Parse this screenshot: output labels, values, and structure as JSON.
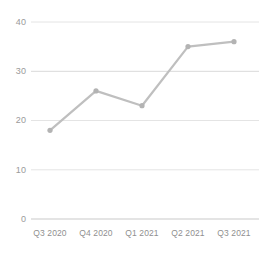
{
  "chart_data": {
    "type": "line",
    "title": "",
    "subtitle": "",
    "xlabel": "",
    "ylabel": "",
    "categories": [
      "Q3 2020",
      "Q4 2020",
      "Q1 2021",
      "Q2 2021",
      "Q3 2021"
    ],
    "values": [
      18,
      26,
      23,
      35,
      36
    ],
    "series": [
      {
        "name": "",
        "values": [
          18,
          26,
          23,
          35,
          36
        ]
      }
    ],
    "ylim": [
      0,
      40
    ],
    "yticks": [
      0,
      10,
      20,
      30,
      40
    ],
    "ytick_labels": [
      "0",
      "10",
      "20",
      "30",
      "40"
    ],
    "xtick_labels": [
      "Q3 2020",
      "Q4 2020",
      "Q1 2021",
      "Q2 2021",
      "Q3 2021"
    ],
    "grid": true,
    "grid_axis": "y",
    "legend": false,
    "legend_position": "none",
    "markers": true,
    "marker_shape": "circle",
    "annotations": [],
    "colors": {
      "line": "#bfbfbf",
      "marker": "#b5b5b5",
      "grid": "#e2e2e2",
      "axis": "#c9c9c9",
      "tick_text": "#9a9a9a",
      "background": "#ffffff"
    }
  },
  "axes": {
    "y": {
      "ticks": [
        {
          "label": "40",
          "value": 40
        },
        {
          "label": "30",
          "value": 30
        },
        {
          "label": "20",
          "value": 20
        },
        {
          "label": "10",
          "value": 10
        },
        {
          "label": "0",
          "value": 0
        }
      ]
    },
    "x": {
      "ticks": [
        {
          "label": "Q3 2020"
        },
        {
          "label": "Q4 2020"
        },
        {
          "label": "Q1 2021"
        },
        {
          "label": "Q2 2021"
        },
        {
          "label": "Q3 2021"
        }
      ]
    }
  }
}
